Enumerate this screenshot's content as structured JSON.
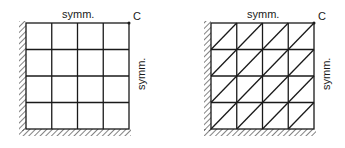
{
  "figures": [
    {
      "id": "left",
      "mesh_type": "quadrilateral",
      "grid": {
        "rows": 4,
        "cols": 4
      },
      "top_label": "symm.",
      "right_label": "symm.",
      "corner_label": "C",
      "diagonals": false
    },
    {
      "id": "right",
      "mesh_type": "triangular",
      "grid": {
        "rows": 4,
        "cols": 4
      },
      "top_label": "symm.",
      "right_label": "symm.",
      "corner_label": "C",
      "diagonals": true
    }
  ],
  "colors": {
    "line": "#1a1a1a",
    "background": "#ffffff"
  }
}
